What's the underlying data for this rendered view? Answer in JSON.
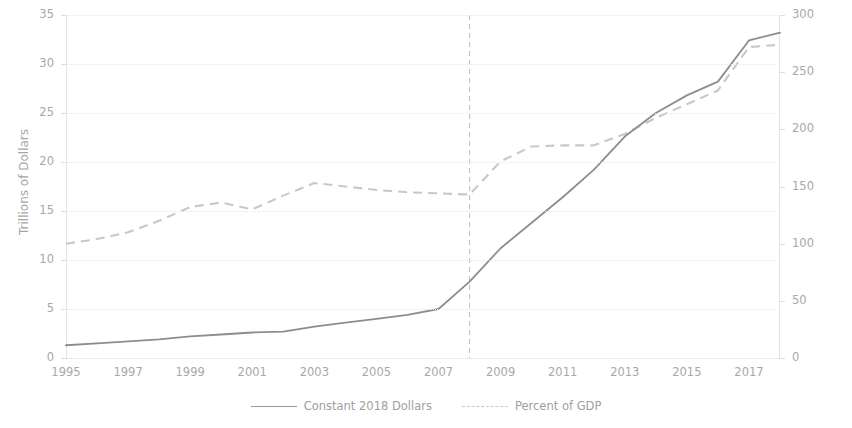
{
  "chart_data": {
    "type": "line",
    "title": "",
    "xlabel": "",
    "ylabel": "Trillions of Dollars",
    "y2label": "Percent of GDP",
    "x": [
      1995,
      1996,
      1997,
      1998,
      1999,
      2000,
      2001,
      2002,
      2003,
      2004,
      2005,
      2006,
      2007,
      2008,
      2009,
      2010,
      2011,
      2012,
      2013,
      2014,
      2015,
      2016,
      2017,
      2018
    ],
    "xlim": [
      1995,
      2018
    ],
    "ylim": [
      0,
      35
    ],
    "y2lim": [
      0,
      300
    ],
    "yticks": [
      0,
      5,
      10,
      15,
      20,
      25,
      30,
      35
    ],
    "y2ticks": [
      0,
      50,
      100,
      150,
      200,
      250,
      300
    ],
    "xticks": [
      1995,
      1997,
      1999,
      2001,
      2003,
      2005,
      2007,
      2009,
      2011,
      2013,
      2015,
      2017
    ],
    "grid": true,
    "legend_position": "bottom",
    "series": [
      {
        "name": "Constant 2018 Dollars",
        "axis": "left",
        "style": "solid",
        "color": "#8d8d8d",
        "units": "Trillions of Dollars",
        "values": [
          1.3,
          1.5,
          1.7,
          1.9,
          2.2,
          2.4,
          2.6,
          2.7,
          3.2,
          3.6,
          4.0,
          4.4,
          5.0,
          7.8,
          11.2,
          13.8,
          16.4,
          19.2,
          22.6,
          25.0,
          26.8,
          28.2,
          32.4,
          33.2
        ]
      },
      {
        "name": "Percent of GDP",
        "axis": "right",
        "style": "dashed",
        "color": "#c8c8c8",
        "units": "Percent of GDP",
        "values": [
          100,
          104,
          110,
          120,
          132,
          136,
          130,
          142,
          153,
          150,
          147,
          145,
          144,
          143,
          172,
          185,
          186,
          186,
          196,
          210,
          222,
          234,
          272,
          274
        ]
      }
    ],
    "annotations": [
      {
        "type": "vertical-line",
        "name": "reference-line-2008",
        "x": 2008,
        "style": "dashed",
        "color": "#c6c6c6"
      }
    ]
  },
  "axes": {
    "left": {
      "title": "Trillions of Dollars",
      "ticks": [
        "35",
        "30",
        "25",
        "20",
        "15",
        "10",
        "5",
        "0"
      ]
    },
    "right": {
      "title": "Percent of GDP",
      "ticks": [
        "300",
        "250",
        "200",
        "150",
        "100",
        "50",
        "0"
      ]
    },
    "bottom": {
      "ticks": [
        "1995",
        "1997",
        "1999",
        "2001",
        "2003",
        "2005",
        "2007",
        "2009",
        "2011",
        "2013",
        "2015",
        "2017"
      ]
    }
  },
  "legend": {
    "items": [
      {
        "label": "Constant 2018 Dollars",
        "style": "solid"
      },
      {
        "label": "Percent of GDP",
        "style": "dashed"
      }
    ]
  },
  "title_sliver": ""
}
